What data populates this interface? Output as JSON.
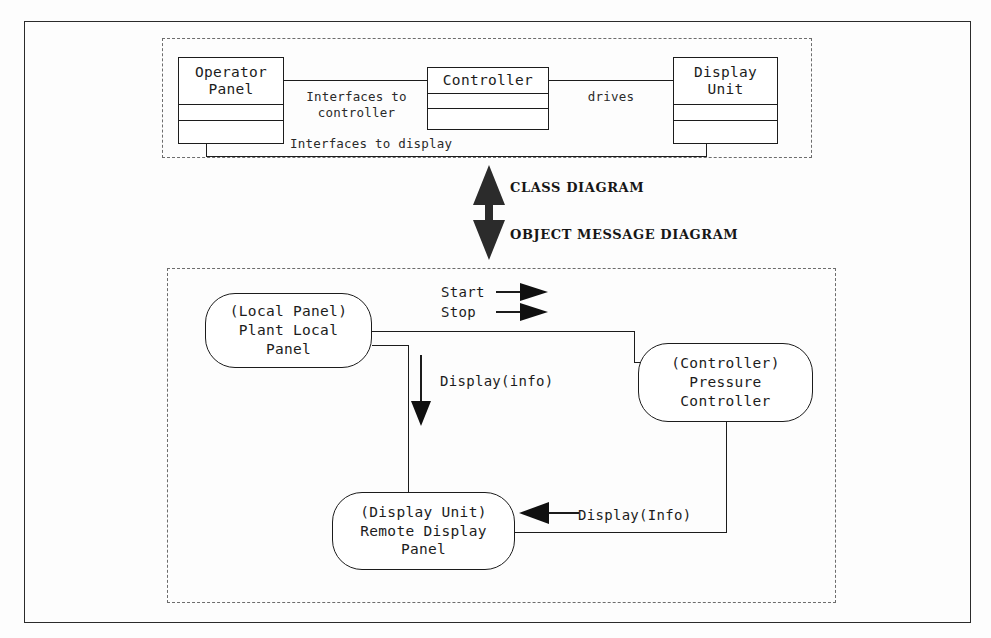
{
  "figure": {
    "background_color": "#fdfdfd",
    "line_color": "#1c1c1c",
    "dash_color": "#6d6d6d"
  },
  "split": {
    "class_diagram_caption": "CLASS DIAGRAM",
    "object_diagram_caption": "OBJECT MESSAGE DIAGRAM",
    "up_arrow_icon": "arrow-up-icon",
    "down_arrow_icon": "arrow-down-icon"
  },
  "class_diagram": {
    "classes": [
      {
        "id": "operator-panel",
        "name": "Operator\nPanel",
        "compartments": 3
      },
      {
        "id": "controller",
        "name": "Controller",
        "compartments": 3
      },
      {
        "id": "display-unit",
        "name": "Display\nUnit",
        "compartments": 3
      }
    ],
    "associations": [
      {
        "id": "op-to-controller",
        "label": "Interfaces to\ncontroller",
        "from": "Operator Panel",
        "to": "Controller"
      },
      {
        "id": "controller-drives",
        "label": "drives",
        "from": "Controller",
        "to": "Display Unit"
      },
      {
        "id": "op-to-display",
        "label": "Interfaces to display",
        "from": "Operator Panel",
        "to": "Display Unit"
      }
    ]
  },
  "object_diagram": {
    "objects": [
      {
        "id": "local-panel",
        "label": "(Local Panel)\nPlant Local\nPanel"
      },
      {
        "id": "pressure-ctrl",
        "label": "(Controller)\nPressure\nController"
      },
      {
        "id": "remote-display",
        "label": "(Display Unit)\nRemote Display\nPanel"
      }
    ],
    "messages": [
      {
        "id": "start",
        "label": "Start",
        "arrow": "arrow-right-icon"
      },
      {
        "id": "stop",
        "label": "Stop",
        "arrow": "arrow-right-icon"
      },
      {
        "id": "display-info",
        "label": "Display(info)",
        "arrow": "arrow-down-icon"
      },
      {
        "id": "display-Info",
        "label": "Display(Info)",
        "arrow": "arrow-left-icon"
      }
    ]
  }
}
